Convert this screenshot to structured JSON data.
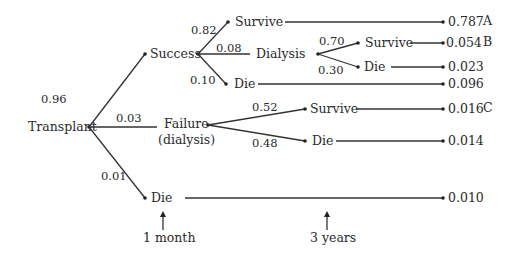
{
  "diagram": {
    "type": "decision-tree",
    "root": {
      "label": "Transplant"
    },
    "first_stage": [
      {
        "label": "Success",
        "probability": "0.96"
      },
      {
        "label_line1": "Failure",
        "label_line2": "(dialysis)",
        "probability": "0.03"
      },
      {
        "label": "Die",
        "probability": "0.01",
        "outcome": "0.010"
      }
    ],
    "success_branches": [
      {
        "label": "Survive",
        "probability": "0.82",
        "outcome": "0.787",
        "tag": "A"
      },
      {
        "label": "Dialysis",
        "probability": "0.08"
      },
      {
        "label": "Die",
        "probability": "0.10",
        "outcome": "0.096"
      }
    ],
    "dialysis_branches": [
      {
        "label": "Survive",
        "probability": "0.70",
        "outcome": "0.054",
        "tag": "B"
      },
      {
        "label": "Die",
        "probability": "0.30",
        "outcome": "0.023"
      }
    ],
    "failure_branches": [
      {
        "label": "Survive",
        "probability": "0.52",
        "outcome": "0.016",
        "tag": "C"
      },
      {
        "label": "Die",
        "probability": "0.48",
        "outcome": "0.014"
      }
    ],
    "time_markers": [
      {
        "label": "1 month"
      },
      {
        "label": "3 years"
      }
    ],
    "colors": {
      "ink": "#2a2a2a",
      "background": "#ffffff"
    }
  }
}
